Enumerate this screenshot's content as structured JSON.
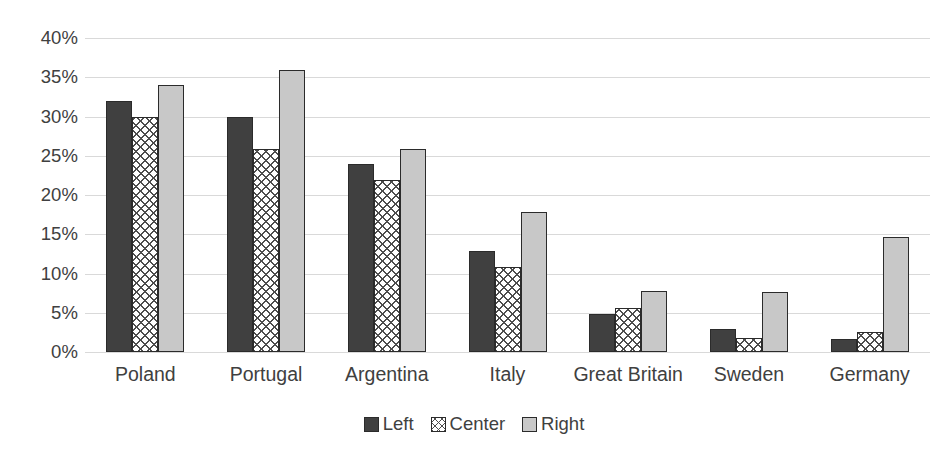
{
  "chart_data": {
    "type": "bar",
    "title": "",
    "subtitle": "",
    "xlabel": "",
    "ylabel": "",
    "categories": [
      "Poland",
      "Portugal",
      "Argentina",
      "Italy",
      "Great Britain",
      "Sweden",
      "Germany"
    ],
    "series": [
      {
        "name": "Left",
        "values": [
          32.0,
          30.0,
          23.9,
          12.9,
          4.8,
          2.9,
          1.6
        ],
        "color": "#404040",
        "pattern": "solid"
      },
      {
        "name": "Center",
        "values": [
          30.0,
          25.8,
          21.9,
          10.8,
          5.6,
          1.8,
          2.6
        ],
        "color": "#ffffff",
        "pattern": "cross-hatch"
      },
      {
        "name": "Right",
        "values": [
          34.0,
          35.9,
          25.8,
          17.9,
          7.8,
          7.7,
          14.7
        ],
        "color": "#c8c8c8",
        "pattern": "solid"
      }
    ],
    "ylim": [
      0,
      40
    ],
    "ytick_values": [
      0,
      5,
      10,
      15,
      20,
      25,
      30,
      35,
      40
    ],
    "ytick_labels": [
      "0%",
      "5%",
      "10%",
      "15%",
      "20%",
      "25%",
      "30%",
      "35%",
      "40%"
    ],
    "grid": true,
    "grid_axis": "y",
    "grid_color": "#d9d9d9",
    "legend": true,
    "legend_position": "bottom",
    "legend_entries": [
      "Left",
      "Center",
      "Right"
    ],
    "background_color": "#ffffff",
    "text_color": "#404040"
  }
}
